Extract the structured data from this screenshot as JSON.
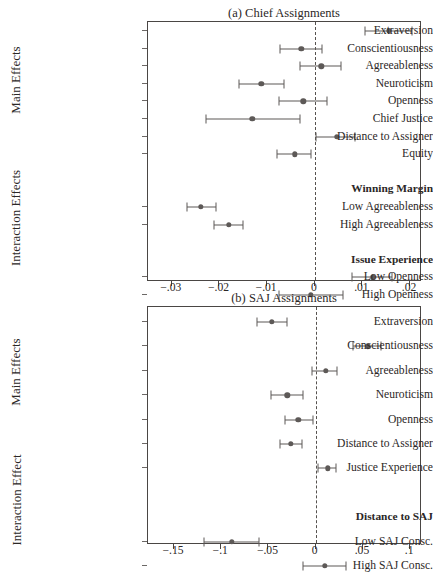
{
  "figure": {
    "caption_clipped": "(a) Chief Assignments / (b) SAJ Assignments coefficient plot"
  },
  "panels": [
    {
      "id": "chief",
      "title": "(a) Chief Assignments",
      "group_labels": [
        "Main Effects",
        "Interaction Effects"
      ],
      "axis": {
        "min": -0.035,
        "max": 0.0225,
        "ticks": [
          -0.03,
          -0.02,
          -0.01,
          0,
          0.01,
          0.02
        ],
        "tick_labels": [
          "−.03",
          "−.02",
          "−.01",
          "0",
          ".01",
          ".02"
        ],
        "zero": 0
      },
      "rows": [
        {
          "label": "Extraversion",
          "type": "point",
          "est": 0.0155,
          "lo": 0.0106,
          "hi": 0.0205
        },
        {
          "label": "Conscientiousness",
          "type": "point",
          "est": -0.0028,
          "lo": -0.0072,
          "hi": 0.0016
        },
        {
          "label": "Agreeableness",
          "type": "point",
          "est": 0.0014,
          "lo": -0.0032,
          "hi": 0.0056
        },
        {
          "label": "Neuroticism",
          "type": "point",
          "est": -0.0112,
          "lo": -0.0159,
          "hi": -0.0064
        },
        {
          "label": "Openness",
          "type": "point",
          "est": -0.0024,
          "lo": -0.0076,
          "hi": 0.0026
        },
        {
          "label": "Chief Justice",
          "type": "point",
          "est": -0.0131,
          "lo": -0.0229,
          "hi": -0.0032
        },
        {
          "label": "Distance to Assigner",
          "type": "point",
          "est": 0.0046,
          "lo": 0.0002,
          "hi": 0.0084
        },
        {
          "label": "Equity",
          "type": "point",
          "est": -0.0042,
          "lo": -0.008,
          "hi": -0.0008
        },
        {
          "label": "",
          "type": "spacer"
        },
        {
          "label": "Winning Margin",
          "type": "header"
        },
        {
          "label": "Low Agreeableness",
          "type": "point",
          "est": -0.0239,
          "lo": -0.0269,
          "hi": -0.0207
        },
        {
          "label": "High Agreeableness",
          "type": "point",
          "est": -0.0181,
          "lo": -0.0211,
          "hi": -0.0151
        },
        {
          "label": "",
          "type": "spacer"
        },
        {
          "label": "Issue Experience",
          "type": "header"
        },
        {
          "label": "Low Openness",
          "type": "point",
          "est": 0.0122,
          "lo": 0.0078,
          "hi": 0.0163
        },
        {
          "label": "High Openness",
          "type": "point",
          "est": -0.0008,
          "lo": -0.0076,
          "hi": 0.006
        }
      ]
    },
    {
      "id": "saj",
      "title": "(b) SAJ Assignments",
      "group_labels": [
        "Main Effects",
        "Interaction Effect"
      ],
      "axis": {
        "min": -0.1775,
        "max": 0.1125,
        "ticks": [
          -0.15,
          -0.1,
          -0.05,
          0,
          0.05,
          0.1
        ],
        "tick_labels": [
          "−.15",
          "−.1",
          "−.05",
          "0",
          ".05",
          ".1"
        ],
        "zero": 0
      },
      "rows": [
        {
          "label": "Extraversion",
          "type": "point",
          "est": -0.0463,
          "lo": -0.0618,
          "hi": -0.0299
        },
        {
          "label": "Conscientiousness",
          "type": "point",
          "est": 0.055,
          "lo": 0.0396,
          "hi": 0.0695
        },
        {
          "label": "Agreeableness",
          "type": "point",
          "est": 0.0106,
          "lo": -0.0039,
          "hi": 0.0222
        },
        {
          "label": "Neuroticism",
          "type": "point",
          "est": -0.0299,
          "lo": -0.0473,
          "hi": -0.0135
        },
        {
          "label": "Openness",
          "type": "point",
          "est": -0.0183,
          "lo": -0.0328,
          "hi": -0.0029
        },
        {
          "label": "Distance to Assigner",
          "type": "point",
          "est": -0.0261,
          "lo": -0.0377,
          "hi": -0.0145
        },
        {
          "label": "Justice Experience",
          "type": "point",
          "est": 0.0125,
          "lo": 0.0019,
          "hi": 0.0212
        },
        {
          "label": "",
          "type": "spacer"
        },
        {
          "label": "Distance to SAJ",
          "type": "header"
        },
        {
          "label": "Low SAJ Consc.",
          "type": "point",
          "est": -0.0888,
          "lo": -0.1187,
          "hi": -0.0598
        },
        {
          "label": "High SAJ Consc.",
          "type": "point",
          "est": 0.0097,
          "lo": -0.0135,
          "hi": 0.0319
        }
      ]
    }
  ],
  "chart_data": {
    "type": "scatter",
    "xlabel": "",
    "ylabel": "",
    "subplots": [
      {
        "title": "(a) Chief Assignments",
        "xlim": [
          -0.035,
          0.0225
        ],
        "xticks": [
          -0.03,
          -0.02,
          -0.01,
          0,
          0.01,
          0.02
        ],
        "reference_line": 0,
        "grid": false,
        "categories": [
          "Extraversion",
          "Conscientiousness",
          "Agreeableness",
          "Neuroticism",
          "Openness",
          "Chief Justice",
          "Distance to Assigner",
          "Equity",
          "Low Agreeableness",
          "High Agreeableness",
          "Low Openness",
          "High Openness"
        ],
        "estimates": [
          0.0155,
          -0.0028,
          0.0014,
          -0.0112,
          -0.0024,
          -0.0131,
          0.0046,
          -0.0042,
          -0.0239,
          -0.0181,
          0.0122,
          -0.0008
        ],
        "ci_low": [
          0.0106,
          -0.0072,
          -0.0032,
          -0.0159,
          -0.0076,
          -0.0229,
          0.0002,
          -0.008,
          -0.0269,
          -0.0211,
          0.0078,
          -0.0076
        ],
        "ci_high": [
          0.0205,
          0.0016,
          0.0056,
          -0.0064,
          0.0026,
          -0.0032,
          0.0084,
          -0.0008,
          -0.0207,
          -0.0151,
          0.0163,
          0.006
        ],
        "group_headers": {
          "Winning Margin": [
            "Low Agreeableness",
            "High Agreeableness"
          ],
          "Issue Experience": [
            "Low Openness",
            "High Openness"
          ]
        }
      },
      {
        "title": "(b) SAJ Assignments",
        "xlim": [
          -0.1775,
          0.1125
        ],
        "xticks": [
          -0.15,
          -0.1,
          -0.05,
          0,
          0.05,
          0.1
        ],
        "reference_line": 0,
        "grid": false,
        "categories": [
          "Extraversion",
          "Conscientiousness",
          "Agreeableness",
          "Neuroticism",
          "Openness",
          "Distance to Assigner",
          "Justice Experience",
          "Low SAJ Consc.",
          "High SAJ Consc."
        ],
        "estimates": [
          -0.0463,
          0.055,
          0.0106,
          -0.0299,
          -0.0183,
          -0.0261,
          0.0125,
          -0.0888,
          0.0097
        ],
        "ci_low": [
          -0.0618,
          0.0396,
          -0.0039,
          -0.0473,
          -0.0328,
          -0.0377,
          0.0019,
          -0.1187,
          -0.0135
        ],
        "ci_high": [
          -0.0299,
          0.0695,
          0.0222,
          -0.0135,
          -0.0029,
          -0.0145,
          0.0212,
          -0.0598,
          0.0319
        ],
        "group_headers": {
          "Distance to SAJ": [
            "Low SAJ Consc.",
            "High SAJ Consc."
          ]
        }
      }
    ]
  },
  "colors": {
    "marker": "#5d5957",
    "axis": "#4a4644",
    "text": "#2b2726",
    "zero_line": "#56524f"
  }
}
